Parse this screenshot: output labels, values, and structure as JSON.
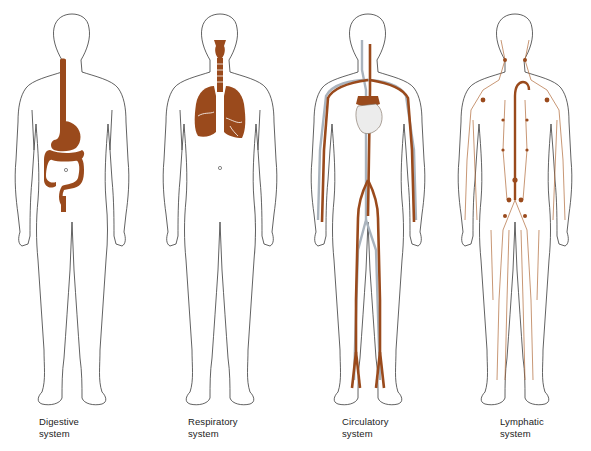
{
  "colors": {
    "organ": "#9a4a1c",
    "outline": "#3a3a3a",
    "vein": "#a9b3bd",
    "background": "#ffffff"
  },
  "figures": [
    {
      "id": "digestive",
      "caption_line1": "Digestive",
      "caption_line2": "system",
      "organ_icon": "digestive-tract"
    },
    {
      "id": "respiratory",
      "caption_line1": "Respiratory",
      "caption_line2": "system",
      "organ_icon": "lungs-trachea"
    },
    {
      "id": "circulatory",
      "caption_line1": "Circulatory",
      "caption_line2": "system",
      "organ_icon": "heart-vessels"
    },
    {
      "id": "lymphatic",
      "caption_line1": "Lymphatic",
      "caption_line2": "system",
      "organ_icon": "lymph-vessels"
    }
  ]
}
